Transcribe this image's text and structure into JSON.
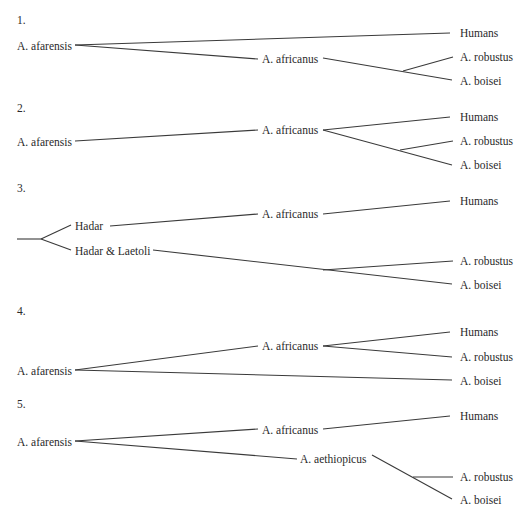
{
  "diagrams": [
    {
      "number": "1.",
      "root": "A. afarensis",
      "mid": "A. africanus",
      "tips": [
        "Humans",
        "A. robustus",
        "A. boisei"
      ]
    },
    {
      "number": "2.",
      "root": "A. afarensis",
      "mid": "A. africanus",
      "tips": [
        "Humans",
        "A. robustus",
        "A. boisei"
      ]
    },
    {
      "number": "3.",
      "root_a": "Hadar",
      "root_b": "Hadar & Laetoli",
      "mid": "A. africanus",
      "tips": [
        "Humans",
        "A. robustus",
        "A. boisei"
      ]
    },
    {
      "number": "4.",
      "root": "A. afarensis",
      "mid": "A. africanus",
      "tips": [
        "Humans",
        "A. robustus",
        "A. boisei"
      ]
    },
    {
      "number": "5.",
      "root": "A. afarensis",
      "mid": "A. africanus",
      "mid2": "A. aethiopicus",
      "tips": [
        "Humans",
        "A. robustus",
        "A. boisei"
      ]
    }
  ]
}
